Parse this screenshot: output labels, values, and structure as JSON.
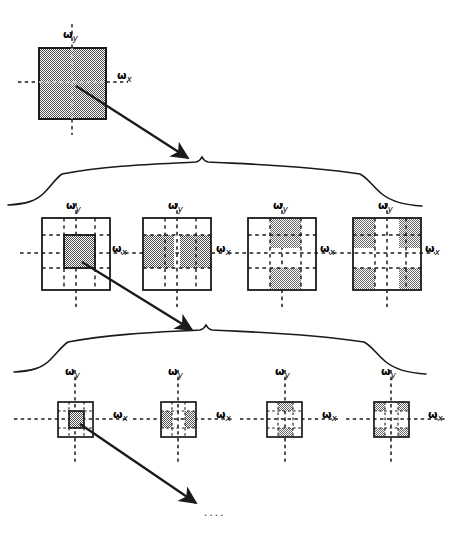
{
  "figure": {
    "type": "diagram",
    "axis_labels": {
      "x": "ω",
      "x_sub": "x",
      "y": "ω",
      "y_sub": "y"
    },
    "ellipsis": "....",
    "colors": {
      "ink": "#1a1a1a",
      "shade_fill": "#808080",
      "shade_fill_light": "#9a9a9a",
      "background": "#ffffff",
      "box_stroke": "#1a1a1a",
      "dash_stroke": "#1a1a1a"
    },
    "levels": [
      {
        "name": "level-0",
        "row": 1,
        "description": "full frequency plane, entirely shaded",
        "panels": [
          {
            "id": "l0-p0",
            "band": "full",
            "grid": 1,
            "shaded_cells": [
              [
                0,
                0
              ]
            ]
          }
        ]
      },
      {
        "name": "level-1",
        "row": 2,
        "description": "3x3 grid panels showing LL, LH, HL, HH bands",
        "panels": [
          {
            "id": "l1-p0",
            "band": "LL",
            "grid": 3,
            "shaded_cells": [
              [
                1,
                1
              ]
            ]
          },
          {
            "id": "l1-p1",
            "band": "LH",
            "grid": 3,
            "shaded_cells": [
              [
                1,
                0
              ],
              [
                1,
                2
              ]
            ]
          },
          {
            "id": "l1-p2",
            "band": "HL",
            "grid": 3,
            "shaded_cells": [
              [
                0,
                1
              ],
              [
                2,
                1
              ]
            ]
          },
          {
            "id": "l1-p3",
            "band": "HH",
            "grid": 3,
            "shaded_cells": [
              [
                0,
                0
              ],
              [
                0,
                2
              ],
              [
                2,
                0
              ],
              [
                2,
                2
              ]
            ]
          }
        ]
      },
      {
        "name": "level-2",
        "row": 3,
        "description": "same four band patterns at the next (smaller) scale",
        "panels": [
          {
            "id": "l2-p0",
            "band": "LL",
            "grid": 3,
            "shaded_cells": [
              [
                1,
                1
              ]
            ]
          },
          {
            "id": "l2-p1",
            "band": "LH",
            "grid": 3,
            "shaded_cells": [
              [
                1,
                0
              ],
              [
                1,
                2
              ]
            ]
          },
          {
            "id": "l2-p2",
            "band": "HL",
            "grid": 3,
            "shaded_cells": [
              [
                0,
                1
              ],
              [
                2,
                1
              ]
            ]
          },
          {
            "id": "l2-p3",
            "band": "HH",
            "grid": 3,
            "shaded_cells": [
              [
                0,
                0
              ],
              [
                0,
                2
              ],
              [
                2,
                0
              ],
              [
                2,
                2
              ]
            ]
          }
        ]
      }
    ],
    "connectors": [
      {
        "id": "arrow-1",
        "from": "level-0 LL region",
        "to": "brace-1 peak"
      },
      {
        "id": "arrow-2",
        "from": "level-1 LL panel",
        "to": "brace-2 peak"
      },
      {
        "id": "arrow-3",
        "from": "level-2 LL panel",
        "to": "ellipsis"
      }
    ],
    "braces": [
      {
        "id": "brace-1",
        "spans": "level-1 row"
      },
      {
        "id": "brace-2",
        "spans": "level-2 row"
      }
    ]
  }
}
